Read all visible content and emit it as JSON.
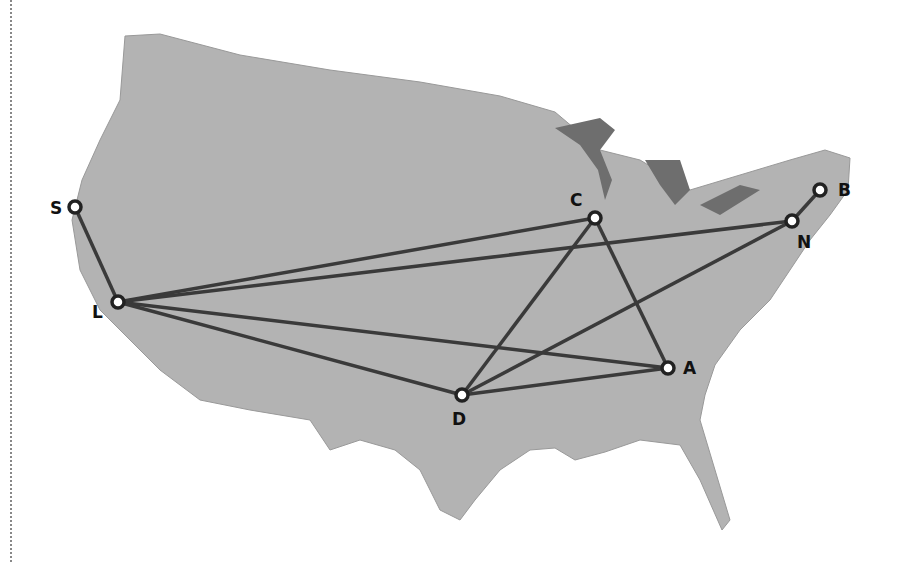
{
  "map": {
    "land_color": "#b3b3b3",
    "lake_color": "#6e6e6e",
    "edge_color": "#3a3a3a",
    "nodes": [
      {
        "id": "S",
        "label": "S",
        "x": 75,
        "y": 207,
        "lx": 50,
        "ly": 214
      },
      {
        "id": "L",
        "label": "L",
        "x": 118,
        "y": 302,
        "lx": 92,
        "ly": 318
      },
      {
        "id": "C",
        "label": "C",
        "x": 595,
        "y": 218,
        "lx": 570,
        "ly": 206
      },
      {
        "id": "N",
        "label": "N",
        "x": 792,
        "y": 221,
        "lx": 797,
        "ly": 248
      },
      {
        "id": "B",
        "label": "B",
        "x": 820,
        "y": 190,
        "lx": 838,
        "ly": 196
      },
      {
        "id": "D",
        "label": "D",
        "x": 462,
        "y": 395,
        "lx": 452,
        "ly": 425
      },
      {
        "id": "A",
        "label": "A",
        "x": 668,
        "y": 368,
        "lx": 683,
        "ly": 374
      }
    ],
    "edges": [
      [
        "S",
        "L"
      ],
      [
        "L",
        "C"
      ],
      [
        "L",
        "N"
      ],
      [
        "L",
        "A"
      ],
      [
        "L",
        "D"
      ],
      [
        "C",
        "D"
      ],
      [
        "C",
        "A"
      ],
      [
        "N",
        "D"
      ],
      [
        "N",
        "B"
      ],
      [
        "D",
        "A"
      ]
    ]
  }
}
